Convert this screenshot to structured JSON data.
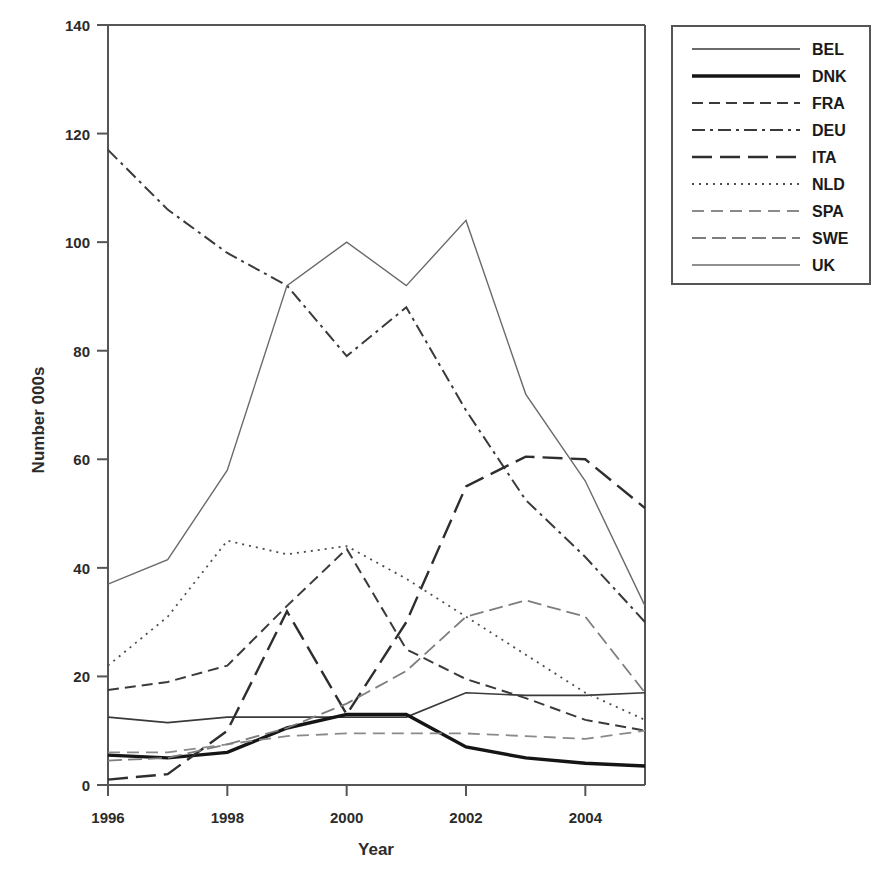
{
  "chart_data": {
    "type": "line",
    "title": "",
    "xlabel": "Year",
    "ylabel": "Number 000s",
    "xlim": [
      1996,
      2005
    ],
    "ylim": [
      0,
      140
    ],
    "x": [
      1996,
      1997,
      1998,
      1999,
      2000,
      2001,
      2002,
      2003,
      2004,
      2005
    ],
    "xticks": [
      1996,
      1998,
      2000,
      2002,
      2004
    ],
    "xticklabels": [
      "1996",
      "1998",
      "2000",
      "2002",
      "2004"
    ],
    "yticks": [
      0,
      20,
      40,
      60,
      80,
      100,
      120,
      140
    ],
    "yticklabels": [
      "0",
      "20",
      "40",
      "60",
      "80",
      "100",
      "120",
      "140"
    ],
    "grid": false,
    "legend_position": "outside-right-top",
    "series": [
      {
        "name": "BEL",
        "style": "solid-thin",
        "color": "#3a3a3a",
        "values": [
          12.5,
          11.5,
          12.5,
          12.5,
          12.5,
          12.5,
          17.0,
          16.5,
          16.5,
          17.0
        ]
      },
      {
        "name": "DNK",
        "style": "solid-thick",
        "color": "#151515",
        "values": [
          5.5,
          5.0,
          6.0,
          10.5,
          13.0,
          13.0,
          7.0,
          5.0,
          4.0,
          3.5
        ]
      },
      {
        "name": "FRA",
        "style": "dashed",
        "color": "#3a3a3a",
        "values": [
          17.5,
          19.0,
          22.0,
          33.0,
          43.5,
          25.0,
          19.5,
          16.0,
          12.0,
          10.0
        ]
      },
      {
        "name": "DEU",
        "style": "dash-dot",
        "color": "#3a3a3a",
        "values": [
          117.0,
          106.0,
          98.0,
          92.0,
          79.0,
          88.0,
          69.0,
          52.5,
          42.0,
          30.0
        ]
      },
      {
        "name": "ITA",
        "style": "long-dash",
        "color": "#2e2e2e",
        "values": [
          1.0,
          2.0,
          10.0,
          32.0,
          13.0,
          30.0,
          55.0,
          60.5,
          60.0,
          51.0
        ]
      },
      {
        "name": "NLD",
        "style": "dotted",
        "color": "#4d4d4d",
        "values": [
          22.0,
          31.0,
          45.0,
          42.5,
          44.0,
          38.0,
          31.0,
          24.0,
          17.0,
          12.0
        ]
      },
      {
        "name": "SPA",
        "style": "dashed-light",
        "color": "#8a8a8a",
        "values": [
          6.0,
          6.0,
          7.5,
          9.0,
          9.5,
          9.5,
          9.5,
          9.0,
          8.5,
          10.0
        ]
      },
      {
        "name": "SWE",
        "style": "dashed-medium-light",
        "color": "#7d7d7d",
        "values": [
          4.5,
          5.0,
          7.5,
          10.5,
          15.0,
          21.0,
          31.0,
          34.0,
          31.0,
          17.0
        ]
      },
      {
        "name": "UK",
        "style": "solid-thin-light",
        "color": "#6a6a6a",
        "values": [
          37.0,
          41.5,
          58.0,
          92.0,
          100.0,
          92.0,
          104.0,
          72.0,
          56.0,
          33.0
        ]
      }
    ]
  },
  "legend": {
    "items": [
      {
        "label": "BEL"
      },
      {
        "label": "DNK"
      },
      {
        "label": "FRA"
      },
      {
        "label": "DEU"
      },
      {
        "label": "ITA"
      },
      {
        "label": "NLD"
      },
      {
        "label": "SPA"
      },
      {
        "label": "SWE"
      },
      {
        "label": "UK"
      }
    ]
  }
}
